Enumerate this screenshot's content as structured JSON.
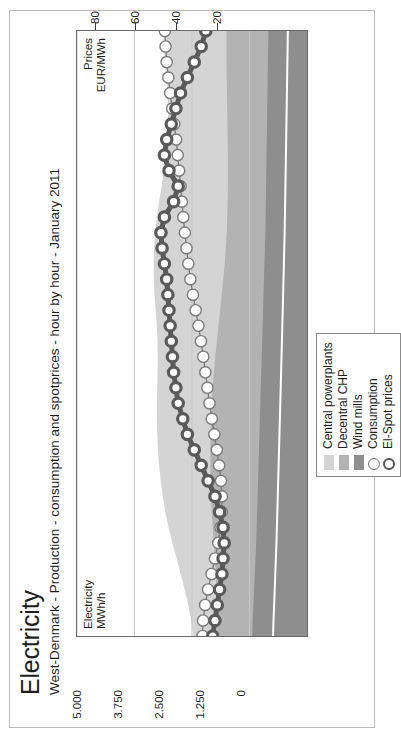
{
  "header": {
    "title": "Electricity",
    "subtitle": "West-Denmark - Production - consumption and spotprices - hour by hour - January 2011"
  },
  "axis_labels": {
    "left": "Electricity\nMWh/h",
    "left_line1": "Electricity",
    "left_line2": "MWh/h",
    "right_line1": "Prices",
    "right_line2": "EUR/MWh"
  },
  "legend": {
    "items": [
      {
        "label": "Central powerplants",
        "marker": "area-swatch",
        "color": "#d4d4d4"
      },
      {
        "label": "Decentral CHP",
        "marker": "area-swatch",
        "color": "#b3b3b3"
      },
      {
        "label": "Wind mills",
        "marker": "area-swatch",
        "color": "#8e8e8e"
      },
      {
        "label": "Consumption",
        "marker": "circle-thin",
        "color": "#6e6e6e"
      },
      {
        "label": "El-Spot prices",
        "marker": "circle-thick",
        "color": "#555555"
      }
    ]
  },
  "colors": {
    "central_powerplants": "#d4d4d4",
    "decentral_chp": "#b3b3b3",
    "wind_mills": "#8e8e8e",
    "consumption_line": "#7a7a7a",
    "spot_price_line": "#5a5a5a",
    "frame": "#6a6a6a",
    "gridline": "#c8c8c8",
    "text": "#1d1d1d"
  },
  "chart_data": {
    "type": "area",
    "title": "Electricity",
    "subtitle": "West-Denmark - Production - consumption and spotprices - hour by hour - January 2011",
    "xlabel": "",
    "ylabel": "Electricity MWh/h",
    "y2label": "Prices EUR/MWh",
    "ylim": [
      0,
      5000
    ],
    "yticks": [
      0,
      1250,
      2500,
      3750,
      5000
    ],
    "ytick_labels": [
      "0",
      "1.250",
      "2.500",
      "3.750",
      "5.000"
    ],
    "y2lim": [
      0,
      100
    ],
    "y2ticks": [
      20,
      40,
      60,
      80
    ],
    "y2tick_labels": [
      "20",
      "40",
      "60",
      "80"
    ],
    "grid": true,
    "legend_position": "bottom-right",
    "x": [
      1,
      2,
      3,
      4,
      5,
      6,
      7,
      8,
      9,
      10,
      11,
      12,
      13,
      14,
      15,
      16,
      17,
      18,
      19,
      20,
      21,
      22,
      23,
      24,
      25,
      26,
      27,
      28,
      29,
      30,
      31,
      32,
      33,
      34,
      35,
      36,
      37,
      38,
      39,
      40
    ],
    "series": [
      {
        "name": "Wind mills",
        "type": "area",
        "stack": "production",
        "color": "#8e8e8e",
        "values": [
          1190,
          1180,
          1165,
          1150,
          1135,
          1120,
          1105,
          1095,
          1085,
          1075,
          1065,
          1055,
          1045,
          1035,
          1025,
          1015,
          1005,
          995,
          985,
          975,
          965,
          955,
          945,
          935,
          925,
          915,
          905,
          900,
          895,
          890,
          885,
          880,
          875,
          870,
          865,
          860,
          855,
          850,
          845,
          840
        ]
      },
      {
        "name": "Decentral CHP",
        "type": "area",
        "stack": "production",
        "color": "#b3b3b3",
        "values": [
          760,
          775,
          795,
          820,
          850,
          885,
          920,
          955,
          985,
          1010,
          1030,
          1045,
          1055,
          1060,
          1060,
          1055,
          1045,
          1030,
          1010,
          985,
          960,
          935,
          910,
          885,
          865,
          850,
          840,
          835,
          830,
          830,
          835,
          840,
          850,
          860,
          870,
          880,
          890,
          900,
          905,
          910
        ]
      },
      {
        "name": "Central powerplants",
        "type": "area",
        "stack": "production",
        "color": "#d4d4d4",
        "values": [
          520,
          560,
          620,
          690,
          760,
          830,
          900,
          960,
          1010,
          1050,
          1085,
          1115,
          1140,
          1160,
          1175,
          1190,
          1205,
          1225,
          1250,
          1290,
          1340,
          1400,
          1460,
          1510,
          1545,
          1560,
          1555,
          1530,
          1490,
          1440,
          1390,
          1345,
          1310,
          1290,
          1285,
          1295,
          1315,
          1340,
          1360,
          1375
        ]
      },
      {
        "name": "Consumption",
        "type": "line",
        "color": "#7a7a7a",
        "marker": "circle-open-thin",
        "values": [
          2270,
          2260,
          2215,
          2150,
          2075,
          2000,
          1930,
          1880,
          1855,
          1850,
          1870,
          1910,
          1960,
          2015,
          2070,
          2120,
          2165,
          2210,
          2255,
          2305,
          2360,
          2420,
          2480,
          2535,
          2580,
          2620,
          2655,
          2690,
          2720,
          2750,
          2780,
          2810,
          2845,
          2885,
          2930,
          2975,
          3015,
          3050,
          3075,
          3090
        ]
      },
      {
        "name": "El-Spot prices",
        "type": "line",
        "axis": "y2",
        "color": "#5a5a5a",
        "marker": "circle-open-thick",
        "values": [
          41,
          40,
          39,
          38,
          37,
          36.5,
          36,
          36.5,
          38,
          40,
          43,
          46,
          49,
          52,
          54,
          56,
          57,
          58,
          58.5,
          59,
          59.5,
          60,
          60.5,
          61,
          62,
          63,
          63.5,
          62,
          58,
          56,
          60,
          62,
          61,
          59,
          57,
          55,
          52,
          49,
          46,
          44
        ]
      }
    ]
  }
}
